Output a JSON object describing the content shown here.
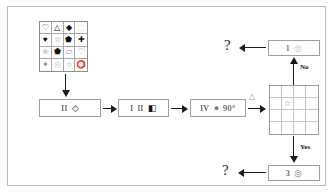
{
  "diagram": {
    "source_grid": {
      "name": "source-symbol-grid",
      "rows": 4,
      "cols": 4,
      "cells": [
        {
          "glyph": "♡",
          "tone": "normal"
        },
        {
          "glyph": "△",
          "tone": "normal"
        },
        {
          "glyph": "◆",
          "tone": "normal"
        },
        {
          "glyph": "⬚",
          "tone": "faint"
        },
        {
          "glyph": "♥",
          "tone": "normal"
        },
        {
          "glyph": "☆",
          "tone": "mid"
        },
        {
          "glyph": "⬟",
          "tone": "normal"
        },
        {
          "glyph": "✚",
          "tone": "normal"
        },
        {
          "glyph": "❀",
          "tone": "faint"
        },
        {
          "glyph": "⬟",
          "tone": "normal"
        },
        {
          "glyph": "▱",
          "tone": "mid"
        },
        {
          "glyph": "♡",
          "tone": "mid"
        },
        {
          "glyph": "✦",
          "tone": "mid"
        },
        {
          "glyph": "◎",
          "tone": "faint"
        },
        {
          "glyph": "○",
          "tone": "mid"
        },
        {
          "glyph": "⭕",
          "tone": "normal"
        }
      ]
    },
    "steps": [
      {
        "name": "step-ii",
        "numeral": "II",
        "glyph": "◇",
        "glyph_tone": "normal"
      },
      {
        "name": "step-iii",
        "numeral": "I",
        "numeral2": "II",
        "glyph": "◧",
        "glyph_tone": "normal"
      },
      {
        "name": "step-iv",
        "numeral": "IV",
        "glyph": "●",
        "glyph_tone": "gray",
        "angle": "90°"
      }
    ],
    "branch_label": "△",
    "answer_grid": {
      "name": "answer-grid",
      "rows": 4,
      "cols": 4,
      "cells": [
        "",
        "",
        "",
        "",
        "",
        "☆",
        "",
        "",
        "",
        "",
        "",
        "",
        "",
        "",
        "",
        ""
      ]
    },
    "branches": {
      "no_label": "No",
      "yes_label": "Yes"
    },
    "outputs": [
      {
        "name": "output-top",
        "count": "1",
        "glyph": "◎",
        "tone": "faint"
      },
      {
        "name": "output-bottom",
        "count": "3",
        "glyph": "◎",
        "tone": "gray"
      }
    ],
    "unknowns": {
      "top": "?",
      "bottom": "?"
    }
  }
}
